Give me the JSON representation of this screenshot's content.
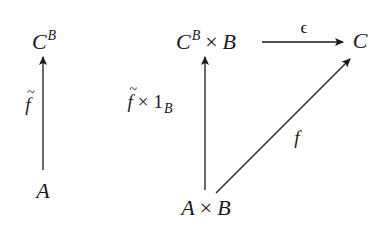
{
  "diagram": {
    "type": "commutative-diagram",
    "left": {
      "top_node": {
        "base": "C",
        "sup": "B"
      },
      "bottom_node": {
        "base": "A"
      },
      "arrow_label": {
        "base": "f",
        "decoration": "tilde"
      }
    },
    "right": {
      "top_left_node": {
        "base": "C",
        "sup": "B",
        "op": "×",
        "rhs": "B"
      },
      "top_right_node": {
        "base": "C"
      },
      "bottom_node": {
        "lhs": "A",
        "op": "×",
        "rhs": "B"
      },
      "vertical_arrow_label": {
        "base": "f",
        "decoration": "tilde",
        "op": "×",
        "rhs": "1",
        "sub": "B"
      },
      "horizontal_arrow_label": "ϵ",
      "diagonal_arrow_label": "f"
    },
    "arrows": [
      {
        "from": "A",
        "to": "C^B",
        "label": "f̃"
      },
      {
        "from": "A × B",
        "to": "C^B × B",
        "label": "f̃ × 1_B"
      },
      {
        "from": "C^B × B",
        "to": "C",
        "label": "ϵ"
      },
      {
        "from": "A × B",
        "to": "C",
        "label": "f"
      }
    ],
    "colors": {
      "ink": "#1a1a1a",
      "background": "#ffffff"
    }
  }
}
